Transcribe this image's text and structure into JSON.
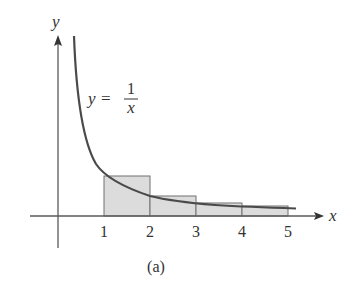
{
  "figure": {
    "caption": "(a)",
    "function_label": {
      "lhs": "y",
      "equals": "=",
      "numerator": "1",
      "denominator": "x"
    },
    "axes": {
      "x_label": "x",
      "y_label": "y",
      "x_ticks": [
        "1",
        "2",
        "3",
        "4",
        "5"
      ]
    },
    "rectangles": [
      {
        "from": 1,
        "to": 2,
        "height": 1
      },
      {
        "from": 2,
        "to": 3,
        "height": 0.5
      },
      {
        "from": 3,
        "to": 4,
        "height": 0.3333
      },
      {
        "from": 4,
        "to": 5,
        "height": 0.25
      }
    ],
    "colors": {
      "curve": "#4a4a4a",
      "axis": "#5a5a5a",
      "rect_fill": "#dcdcdc",
      "rect_stroke": "#707070",
      "text": "#333333"
    }
  }
}
